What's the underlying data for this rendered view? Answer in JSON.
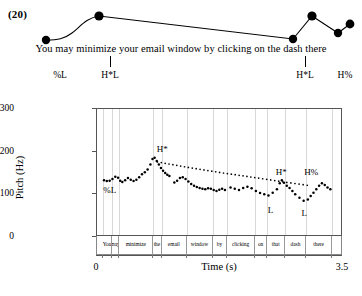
{
  "example": {
    "number": "(20)"
  },
  "utterance": {
    "text": "You may minimize your email window by clicking on the dash there"
  },
  "tone_tier": {
    "ticks": [
      {
        "label": "%L",
        "label_x": 60,
        "tick_x": null
      },
      {
        "label": "H*L",
        "label_x": 110,
        "tick_x": 110
      },
      {
        "label": "H*L",
        "label_x": 305,
        "tick_x": 305
      },
      {
        "label": "H%",
        "label_x": 345,
        "tick_x": null
      }
    ]
  },
  "figure": {
    "ylabel": "Pitch (Hz)",
    "xlabel": "Time (s)",
    "yticks": [
      0,
      100,
      200,
      300
    ],
    "xticks": [
      {
        "value": "0",
        "pos": 0
      },
      {
        "value": "3.5",
        "pos": 1
      }
    ],
    "annotations": [
      {
        "label": "%L",
        "t": 0.18,
        "hz": 108
      },
      {
        "label": "H*",
        "t": 0.93,
        "hz": 205
      },
      {
        "label": "H*",
        "t": 2.62,
        "hz": 150
      },
      {
        "label": "L",
        "t": 2.47,
        "hz": 62
      },
      {
        "label": "H%",
        "t": 3.05,
        "hz": 150
      },
      {
        "label": "L",
        "t": 2.95,
        "hz": 55
      }
    ],
    "words": [
      {
        "text": "You",
        "start": 0.09,
        "end": 0.21
      },
      {
        "text": "may",
        "start": 0.21,
        "end": 0.32
      },
      {
        "text": "minimize",
        "start": 0.32,
        "end": 0.8
      },
      {
        "text": "the",
        "start": 0.8,
        "end": 0.92
      },
      {
        "text": "email",
        "start": 0.92,
        "end": 1.28
      },
      {
        "text": "window",
        "start": 1.28,
        "end": 1.65
      },
      {
        "text": "by",
        "start": 1.65,
        "end": 1.85
      },
      {
        "text": "clicking",
        "start": 1.85,
        "end": 2.25
      },
      {
        "text": "on",
        "start": 2.25,
        "end": 2.42
      },
      {
        "text": "that",
        "start": 2.42,
        "end": 2.68
      },
      {
        "text": "dash",
        "start": 2.68,
        "end": 2.98
      },
      {
        "text": "there",
        "start": 2.98,
        "end": 3.34
      }
    ]
  },
  "chart_data": {
    "type": "line",
    "title": "",
    "xlabel": "Time (s)",
    "ylabel": "Pitch (Hz)",
    "xlim": [
      0,
      3.5
    ],
    "ylim": [
      0,
      300
    ],
    "grid": "vertical-word-boundaries",
    "legend": "none",
    "series": [
      {
        "name": "f0 contour",
        "style": "dotted-thick",
        "points": [
          [
            0.1,
            133
          ],
          [
            0.14,
            131
          ],
          [
            0.18,
            132
          ],
          [
            0.22,
            136
          ],
          [
            0.26,
            141
          ],
          [
            0.3,
            139
          ],
          [
            0.33,
            132
          ],
          [
            0.36,
            129
          ],
          [
            0.4,
            133
          ],
          [
            0.44,
            138
          ],
          [
            0.48,
            134
          ],
          [
            0.52,
            131
          ],
          [
            0.56,
            134
          ],
          [
            0.6,
            140
          ],
          [
            0.64,
            147
          ],
          [
            0.68,
            152
          ],
          [
            0.72,
            158
          ],
          [
            0.76,
            170
          ],
          [
            0.79,
            183
          ],
          [
            0.82,
            186
          ],
          [
            0.85,
            178
          ],
          [
            0.88,
            170
          ],
          [
            0.91,
            162
          ],
          [
            0.94,
            155
          ],
          [
            0.97,
            150
          ],
          [
            1.0,
            146
          ],
          [
            1.03,
            143
          ],
          [
            1.1,
            128
          ],
          [
            1.14,
            132
          ],
          [
            1.18,
            138
          ],
          [
            1.22,
            140
          ],
          [
            1.26,
            136
          ],
          [
            1.3,
            130
          ],
          [
            1.34,
            124
          ],
          [
            1.38,
            120
          ],
          [
            1.42,
            117
          ],
          [
            1.46,
            115
          ],
          [
            1.5,
            113
          ],
          [
            1.54,
            112
          ],
          [
            1.58,
            114
          ],
          [
            1.62,
            113
          ],
          [
            1.66,
            110
          ],
          [
            1.7,
            108
          ],
          [
            1.74,
            111
          ],
          [
            1.78,
            113
          ],
          [
            1.82,
            110
          ],
          [
            1.9,
            116
          ],
          [
            1.96,
            113
          ],
          [
            2.02,
            110
          ],
          [
            2.08,
            115
          ],
          [
            2.14,
            118
          ],
          [
            2.2,
            114
          ],
          [
            2.26,
            108
          ],
          [
            2.32,
            103
          ],
          [
            2.38,
            100
          ],
          [
            2.44,
            97
          ],
          [
            2.5,
            104
          ],
          [
            2.56,
            112
          ],
          [
            2.6,
            126
          ],
          [
            2.63,
            133
          ],
          [
            2.66,
            127
          ],
          [
            2.7,
            120
          ],
          [
            2.74,
            115
          ],
          [
            2.78,
            108
          ],
          [
            2.82,
            100
          ],
          [
            2.88,
            92
          ],
          [
            2.94,
            85
          ],
          [
            3.0,
            88
          ],
          [
            3.04,
            96
          ],
          [
            3.08,
            104
          ],
          [
            3.12,
            112
          ],
          [
            3.16,
            120
          ],
          [
            3.2,
            126
          ],
          [
            3.24,
            122
          ],
          [
            3.28,
            116
          ],
          [
            3.32,
            112
          ]
        ]
      },
      {
        "name": "declination line",
        "style": "dotted-thin",
        "points": [
          [
            0.86,
            176
          ],
          [
            1.3,
            163
          ],
          [
            1.8,
            150
          ],
          [
            2.3,
            138
          ],
          [
            2.7,
            128
          ],
          [
            3.05,
            120
          ]
        ]
      }
    ]
  },
  "schematic": {
    "dots": [
      {
        "x": 46,
        "y": 40
      },
      {
        "x": 99,
        "y": 16
      },
      {
        "x": 293,
        "y": 39
      },
      {
        "x": 312,
        "y": 16
      },
      {
        "x": 338,
        "y": 33
      },
      {
        "x": 350,
        "y": 24
      }
    ]
  }
}
